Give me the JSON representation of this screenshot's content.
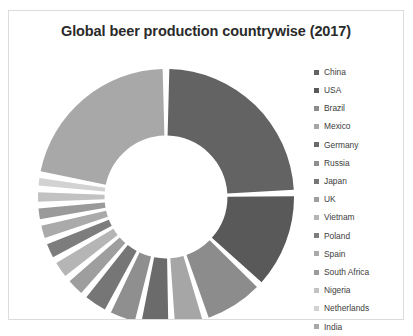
{
  "chart": {
    "title": "Global beer production countrywise (2017)"
  },
  "legend": {
    "position": "right"
  },
  "chart_data": {
    "type": "pie",
    "variant": "exploded-doughnut",
    "title": "Global beer production countrywise (2017)",
    "xlabel": "",
    "ylabel": "",
    "grid": false,
    "legend_position": "right",
    "hole_ratio": 0.48,
    "start_angle_deg": 0,
    "direction": "clockwise",
    "categories": [
      "China",
      "USA",
      "Brazil",
      "Mexico",
      "Germany",
      "Russia",
      "Japan",
      "UK",
      "Vietnam",
      "Poland",
      "Spain",
      "South Africa",
      "Nigeria",
      "Netherlands",
      "India"
    ],
    "values": [
      24.5,
      12.5,
      8.0,
      4.3,
      4.2,
      4.0,
      3.6,
      2.9,
      2.8,
      2.6,
      2.4,
      2.2,
      2.0,
      1.8,
      22.2
    ],
    "unit": "percent",
    "colors": [
      "#636363",
      "#595959",
      "#8c8c8c",
      "#a6a6a6",
      "#6b6b6b",
      "#8f8f8f",
      "#767676",
      "#9e9e9e",
      "#b5b5b5",
      "#7d7d7d",
      "#aaaaaa",
      "#9a9a9a",
      "#c2c2c2",
      "#d2d2d2",
      "#a8a8a8"
    ],
    "series": [
      {
        "name": "Share of global beer production",
        "values": [
          24.5,
          12.5,
          8.0,
          4.3,
          4.2,
          4.0,
          3.6,
          2.9,
          2.8,
          2.6,
          2.4,
          2.2,
          2.0,
          1.8,
          22.2
        ]
      }
    ]
  }
}
